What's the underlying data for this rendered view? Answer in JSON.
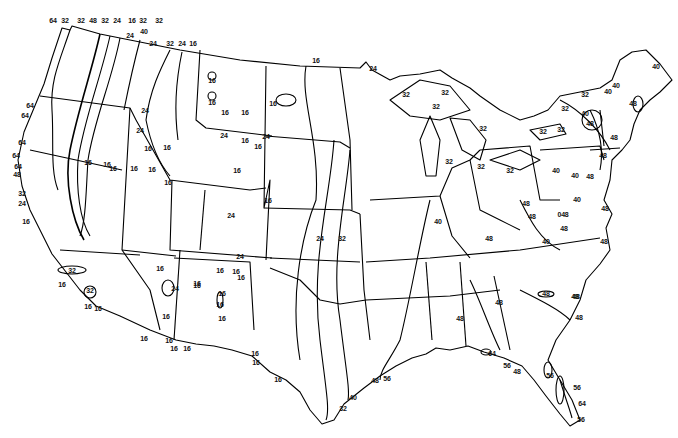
{
  "map": {
    "type": "isoline map",
    "region": "Contiguous United States",
    "line_color": "#000000",
    "background": "#ffffff",
    "contour_values": [
      16,
      24,
      32,
      40,
      48,
      56,
      64
    ],
    "labels": [
      {
        "text": "64",
        "x": 53,
        "y": 20
      },
      {
        "text": "32",
        "x": 65,
        "y": 20
      },
      {
        "text": "32",
        "x": 81,
        "y": 20
      },
      {
        "text": "48",
        "x": 93,
        "y": 20
      },
      {
        "text": "32",
        "x": 105,
        "y": 20
      },
      {
        "text": "24",
        "x": 117,
        "y": 20
      },
      {
        "text": "16",
        "x": 132,
        "y": 20
      },
      {
        "text": "32",
        "x": 143,
        "y": 20
      },
      {
        "text": "32",
        "x": 159,
        "y": 20
      },
      {
        "text": "24",
        "x": 130,
        "y": 35
      },
      {
        "text": "40",
        "x": 144,
        "y": 31
      },
      {
        "text": "24",
        "x": 153,
        "y": 43
      },
      {
        "text": "32",
        "x": 170,
        "y": 43
      },
      {
        "text": "24",
        "x": 182,
        "y": 43
      },
      {
        "text": "16",
        "x": 193,
        "y": 43
      },
      {
        "text": "16",
        "x": 316,
        "y": 60
      },
      {
        "text": "24",
        "x": 373,
        "y": 68
      },
      {
        "text": "16",
        "x": 212,
        "y": 80
      },
      {
        "text": "16",
        "x": 212,
        "y": 102
      },
      {
        "text": "16",
        "x": 225,
        "y": 112
      },
      {
        "text": "16",
        "x": 245,
        "y": 112
      },
      {
        "text": "16",
        "x": 273,
        "y": 103
      },
      {
        "text": "64",
        "x": 30,
        "y": 105
      },
      {
        "text": "64",
        "x": 25,
        "y": 115
      },
      {
        "text": "24",
        "x": 145,
        "y": 110
      },
      {
        "text": "24",
        "x": 224,
        "y": 135
      },
      {
        "text": "24",
        "x": 266,
        "y": 136
      },
      {
        "text": "16",
        "x": 245,
        "y": 140
      },
      {
        "text": "16",
        "x": 258,
        "y": 146
      },
      {
        "text": "24",
        "x": 140,
        "y": 130
      },
      {
        "text": "64",
        "x": 22,
        "y": 142
      },
      {
        "text": "64",
        "x": 16,
        "y": 155
      },
      {
        "text": "64",
        "x": 18,
        "y": 166
      },
      {
        "text": "48",
        "x": 17,
        "y": 174
      },
      {
        "text": "32",
        "x": 22,
        "y": 193
      },
      {
        "text": "24",
        "x": 22,
        "y": 203
      },
      {
        "text": "16",
        "x": 26,
        "y": 221
      },
      {
        "text": "16",
        "x": 88,
        "y": 162
      },
      {
        "text": "16",
        "x": 107,
        "y": 164
      },
      {
        "text": "16",
        "x": 113,
        "y": 168
      },
      {
        "text": "16",
        "x": 134,
        "y": 168
      },
      {
        "text": "16",
        "x": 148,
        "y": 148
      },
      {
        "text": "16",
        "x": 152,
        "y": 169
      },
      {
        "text": "16",
        "x": 167,
        "y": 147
      },
      {
        "text": "16",
        "x": 168,
        "y": 182
      },
      {
        "text": "16",
        "x": 237,
        "y": 170
      },
      {
        "text": "16",
        "x": 268,
        "y": 200
      },
      {
        "text": "24",
        "x": 231,
        "y": 215
      },
      {
        "text": "24",
        "x": 240,
        "y": 256
      },
      {
        "text": "16",
        "x": 236,
        "y": 271
      },
      {
        "text": "16",
        "x": 241,
        "y": 277
      },
      {
        "text": "16",
        "x": 220,
        "y": 270
      },
      {
        "text": "16",
        "x": 222,
        "y": 293
      },
      {
        "text": "24",
        "x": 320,
        "y": 238
      },
      {
        "text": "32",
        "x": 342,
        "y": 238
      },
      {
        "text": "40",
        "x": 438,
        "y": 221
      },
      {
        "text": "32",
        "x": 72,
        "y": 270
      },
      {
        "text": "32",
        "x": 90,
        "y": 290
      },
      {
        "text": "16",
        "x": 62,
        "y": 284
      },
      {
        "text": "16",
        "x": 88,
        "y": 306
      },
      {
        "text": "16",
        "x": 98,
        "y": 308
      },
      {
        "text": "16",
        "x": 160,
        "y": 268
      },
      {
        "text": "16",
        "x": 197,
        "y": 283
      },
      {
        "text": "24",
        "x": 175,
        "y": 288
      },
      {
        "text": "16",
        "x": 220,
        "y": 304
      },
      {
        "text": "16",
        "x": 222,
        "y": 318
      },
      {
        "text": "16",
        "x": 166,
        "y": 316
      },
      {
        "text": "16",
        "x": 144,
        "y": 338
      },
      {
        "text": "16",
        "x": 169,
        "y": 340
      },
      {
        "text": "16",
        "x": 174,
        "y": 348
      },
      {
        "text": "16",
        "x": 187,
        "y": 348
      },
      {
        "text": "16",
        "x": 197,
        "y": 285
      },
      {
        "text": "16",
        "x": 255,
        "y": 353
      },
      {
        "text": "16",
        "x": 256,
        "y": 362
      },
      {
        "text": "16",
        "x": 278,
        "y": 379
      },
      {
        "text": "32",
        "x": 406,
        "y": 94
      },
      {
        "text": "32",
        "x": 445,
        "y": 92
      },
      {
        "text": "32",
        "x": 436,
        "y": 106
      },
      {
        "text": "32",
        "x": 483,
        "y": 128
      },
      {
        "text": "32",
        "x": 449,
        "y": 161
      },
      {
        "text": "32",
        "x": 481,
        "y": 166
      },
      {
        "text": "32",
        "x": 510,
        "y": 170
      },
      {
        "text": "48",
        "x": 489,
        "y": 238
      },
      {
        "text": "40",
        "x": 656,
        "y": 66
      },
      {
        "text": "40",
        "x": 616,
        "y": 85
      },
      {
        "text": "40",
        "x": 608,
        "y": 91
      },
      {
        "text": "32",
        "x": 585,
        "y": 94
      },
      {
        "text": "32",
        "x": 565,
        "y": 108
      },
      {
        "text": "40",
        "x": 585,
        "y": 113
      },
      {
        "text": "48",
        "x": 590,
        "y": 123
      },
      {
        "text": "48",
        "x": 633,
        "y": 103
      },
      {
        "text": "32",
        "x": 561,
        "y": 129
      },
      {
        "text": "32",
        "x": 543,
        "y": 131
      },
      {
        "text": "48",
        "x": 614,
        "y": 137
      },
      {
        "text": "48",
        "x": 603,
        "y": 155
      },
      {
        "text": "40",
        "x": 556,
        "y": 170
      },
      {
        "text": "40",
        "x": 575,
        "y": 175
      },
      {
        "text": "48",
        "x": 590,
        "y": 176
      },
      {
        "text": "40",
        "x": 577,
        "y": 199
      },
      {
        "text": "48",
        "x": 526,
        "y": 203
      },
      {
        "text": "48",
        "x": 532,
        "y": 216
      },
      {
        "text": "048",
        "x": 563,
        "y": 214
      },
      {
        "text": "48",
        "x": 564,
        "y": 228
      },
      {
        "text": "48",
        "x": 605,
        "y": 208
      },
      {
        "text": "40",
        "x": 546,
        "y": 241
      },
      {
        "text": "48",
        "x": 604,
        "y": 241
      },
      {
        "text": "48",
        "x": 576,
        "y": 296
      },
      {
        "text": "48",
        "x": 546,
        "y": 293
      },
      {
        "text": "48",
        "x": 575,
        "y": 296
      },
      {
        "text": "48",
        "x": 499,
        "y": 302
      },
      {
        "text": "48",
        "x": 579,
        "y": 317
      },
      {
        "text": "48",
        "x": 460,
        "y": 318
      },
      {
        "text": "64",
        "x": 492,
        "y": 353
      },
      {
        "text": "56",
        "x": 507,
        "y": 365
      },
      {
        "text": "48",
        "x": 517,
        "y": 371
      },
      {
        "text": "56",
        "x": 550,
        "y": 375
      },
      {
        "text": "56",
        "x": 577,
        "y": 387
      },
      {
        "text": "64",
        "x": 582,
        "y": 403
      },
      {
        "text": "56",
        "x": 581,
        "y": 419
      },
      {
        "text": "48",
        "x": 375,
        "y": 380
      },
      {
        "text": "56",
        "x": 387,
        "y": 378
      },
      {
        "text": "40",
        "x": 353,
        "y": 397
      },
      {
        "text": "32",
        "x": 343,
        "y": 408
      }
    ]
  }
}
